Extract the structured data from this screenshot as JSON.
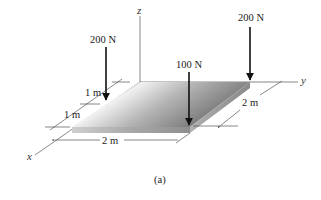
{
  "figure": {
    "caption": "(a)",
    "axes": {
      "x": "x",
      "y": "y",
      "z": "z"
    },
    "forces": [
      {
        "id": "left",
        "label": "200 N"
      },
      {
        "id": "middle",
        "label": "100 N"
      },
      {
        "id": "right",
        "label": "200 N"
      }
    ],
    "dimensions": {
      "x_first": "1 m",
      "x_second": "1 m",
      "length": "2 m",
      "width": "2 m"
    },
    "colors": {
      "plate_top_light": "#f2f2f2",
      "plate_top_dark": "#7a7a7a",
      "plate_edge": "#9a9a9a",
      "lines": "#555555",
      "arrows": "#111111"
    }
  }
}
